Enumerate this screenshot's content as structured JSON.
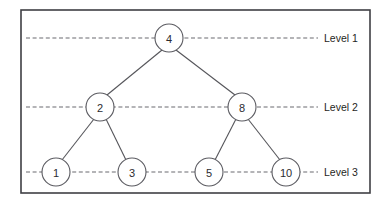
{
  "diagram": {
    "frame": {
      "x": 21,
      "y": 10,
      "width": 349,
      "height": 183
    },
    "colors": {
      "frame_stroke": "#3f3f44",
      "node_stroke": "#5a5a60",
      "node_fill": "#ffffff",
      "edge_stroke": "#55555a",
      "level_line_stroke": "#6b6b70",
      "text": "#1f1f24",
      "background": "#ffffff"
    },
    "node_radius": 14,
    "levels": [
      {
        "id": "level-1",
        "label": "Level 1",
        "y": 38,
        "line_start_x": 26,
        "line_end_x": 318,
        "label_x": 324
      },
      {
        "id": "level-2",
        "label": "Level 2",
        "y": 107,
        "line_start_x": 26,
        "line_end_x": 318,
        "label_x": 324
      },
      {
        "id": "level-3",
        "label": "Level 3",
        "y": 172,
        "line_start_x": 26,
        "line_end_x": 318,
        "label_x": 324
      }
    ],
    "nodes": [
      {
        "id": "node-4",
        "value": "4",
        "cx": 169,
        "cy": 38,
        "level": 1
      },
      {
        "id": "node-2",
        "value": "2",
        "cx": 100,
        "cy": 107,
        "level": 2
      },
      {
        "id": "node-8",
        "value": "8",
        "cx": 242,
        "cy": 107,
        "level": 2
      },
      {
        "id": "node-1",
        "value": "1",
        "cx": 56,
        "cy": 172,
        "level": 3
      },
      {
        "id": "node-3",
        "value": "3",
        "cx": 132,
        "cy": 172,
        "level": 3
      },
      {
        "id": "node-5",
        "value": "5",
        "cx": 209,
        "cy": 172,
        "level": 3
      },
      {
        "id": "node-10",
        "value": "10",
        "cx": 286,
        "cy": 172,
        "level": 3
      }
    ],
    "edges": [
      {
        "id": "edge-4-2",
        "from": "node-4",
        "to": "node-2",
        "x1": 162,
        "y1": 50,
        "x2": 107,
        "y2": 95
      },
      {
        "id": "edge-4-8",
        "from": "node-4",
        "to": "node-8",
        "x1": 176,
        "y1": 50,
        "x2": 235,
        "y2": 95
      },
      {
        "id": "edge-2-1",
        "from": "node-2",
        "to": "node-1",
        "x1": 94,
        "y1": 119,
        "x2": 62,
        "y2": 160
      },
      {
        "id": "edge-2-3",
        "from": "node-2",
        "to": "node-3",
        "x1": 106,
        "y1": 119,
        "x2": 126,
        "y2": 160
      },
      {
        "id": "edge-8-5",
        "from": "node-8",
        "to": "node-5",
        "x1": 236,
        "y1": 119,
        "x2": 215,
        "y2": 160
      },
      {
        "id": "edge-8-10",
        "from": "node-8",
        "to": "node-10",
        "x1": 248,
        "y1": 119,
        "x2": 280,
        "y2": 160
      }
    ]
  }
}
